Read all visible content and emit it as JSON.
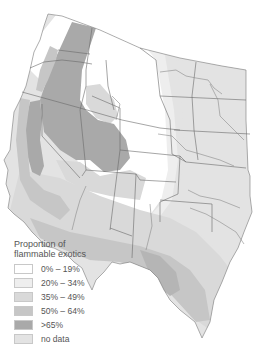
{
  "map": {
    "subject": "Western United States",
    "colors": {
      "cat_0_19": "#ffffff",
      "cat_20_34": "#eeeeee",
      "cat_35_49": "#d9d9d9",
      "cat_50_64": "#c6c6c6",
      "cat_65_plus": "#a9a9a9",
      "no_data": "#e3e3e3",
      "border": "#6a6a6a"
    }
  },
  "legend": {
    "title_line1": "Proportion of",
    "title_line2": "flammable exotics",
    "items": [
      {
        "label": "0% – 19%",
        "color": "#ffffff"
      },
      {
        "label": "20% – 34%",
        "color": "#eeeeee"
      },
      {
        "label": "35% – 49%",
        "color": "#d9d9d9"
      },
      {
        "label": "50% – 64%",
        "color": "#c6c6c6"
      },
      {
        "label": ">65%",
        "color": "#a9a9a9"
      },
      {
        "label": "no data",
        "color": "#e3e3e3"
      }
    ]
  }
}
